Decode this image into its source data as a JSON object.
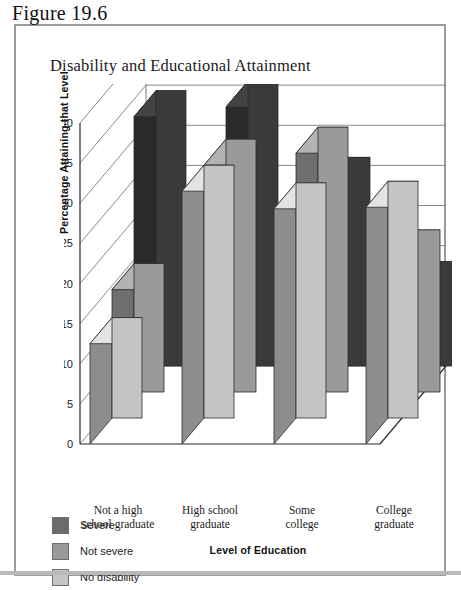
{
  "figure": {
    "label": "Figure 19.6",
    "title": "Disability and Educational Attainment"
  },
  "legend": {
    "items": [
      {
        "label": "Severe",
        "color": "#6b6b6b"
      },
      {
        "label": "Not severe",
        "color": "#9a9a9a"
      },
      {
        "label": "No disability",
        "color": "#c4c4c4"
      }
    ]
  },
  "chart_data": {
    "type": "bar",
    "title": "Disability and Educational Attainment",
    "xlabel": "Level of Education",
    "ylabel": "Percentage Attaining that Level",
    "ylim": [
      0,
      40
    ],
    "yticks": [
      0,
      5,
      10,
      15,
      20,
      25,
      30,
      35,
      40
    ],
    "grid": true,
    "legend_position": "below-left",
    "three_d": true,
    "categories": [
      "Not a high\nschool graduate",
      "High school\ngraduate",
      "Some\ncollege",
      "College\ngraduate"
    ],
    "categories_flat": [
      "Not a high school graduate",
      "High school graduate",
      "Some college",
      "College graduate"
    ],
    "series": [
      {
        "name": "No disability",
        "color": "#c4c4c4",
        "values": [
          12.5,
          31.5,
          29.3,
          29.5
        ]
      },
      {
        "name": "Not severe",
        "color": "#9a9a9a",
        "values": [
          16.0,
          31.5,
          33.0,
          20.2
        ]
      },
      {
        "name": "Severe",
        "color": "#3a3a3a",
        "values": [
          34.3,
          35.5,
          26.0,
          13.0
        ]
      }
    ]
  }
}
